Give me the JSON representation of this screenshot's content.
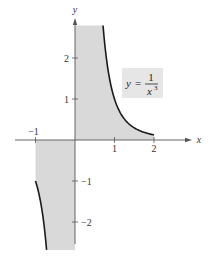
{
  "chart_data": {
    "type": "area",
    "title": "",
    "function_label": {
      "lhs": "y",
      "eq": "=",
      "numerator": "1",
      "denominator_base": "x",
      "denominator_exp": "3"
    },
    "xlabel": "x",
    "ylabel": "y",
    "xlim": [
      -1.5,
      2.95
    ],
    "ylim": [
      -2.95,
      3.0
    ],
    "x_ticks": [
      {
        "value": -1,
        "label": "−1"
      },
      {
        "value": 1,
        "label": "1"
      },
      {
        "value": 2,
        "label": "2"
      }
    ],
    "y_ticks": [
      {
        "value": 2,
        "label": "2"
      },
      {
        "value": 1,
        "label": "1"
      },
      {
        "value": -1,
        "label": "−1"
      },
      {
        "value": -2,
        "label": "−2"
      }
    ],
    "series": [
      {
        "name": "y = 1/x^3 (x from -1 to 0)",
        "x": [
          -1.0,
          -0.95,
          -0.9,
          -0.85,
          -0.8,
          -0.75,
          -0.72
        ],
        "y": [
          -1.0,
          -1.166,
          -1.372,
          -1.628,
          -1.953,
          -2.37,
          -2.68
        ]
      },
      {
        "name": "y = 1/x^3 (x from 0 to 2)",
        "x": [
          0.71,
          0.75,
          0.8,
          0.9,
          1.0,
          1.2,
          1.4,
          1.6,
          1.8,
          2.0
        ],
        "y": [
          2.79,
          2.37,
          1.953,
          1.372,
          1.0,
          0.579,
          0.364,
          0.244,
          0.171,
          0.125
        ]
      }
    ],
    "shaded_regions": [
      {
        "x_from": -1,
        "x_to": 0,
        "description": "region between curve and x-axis, unbounded below (clipped)"
      },
      {
        "x_from": 0,
        "x_to": 2,
        "description": "region between curve and x-axis, unbounded above (clipped)"
      }
    ],
    "colors": {
      "shade": "#d9d9d9",
      "curve": "#1a1a1a",
      "axis": "#555555",
      "label_box": "#e6e6e6"
    },
    "grid": false,
    "legend": "none"
  }
}
